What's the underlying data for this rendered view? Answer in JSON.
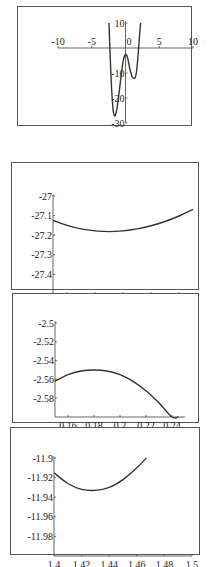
{
  "chart_data": [
    {
      "type": "line",
      "title": "",
      "xlabel": "",
      "ylabel": "",
      "xlim": [
        -10,
        10
      ],
      "ylim": [
        -30,
        10
      ],
      "x_ticks": [
        -10,
        -5,
        0,
        5,
        10
      ],
      "x_tick_labels": [
        "-10",
        "-5",
        "0",
        "5",
        "10"
      ],
      "y_ticks": [
        10,
        -10,
        -20,
        -30
      ],
      "y_tick_labels": [
        "10",
        "-10",
        "-20",
        "-30"
      ],
      "grid": false,
      "series": [
        {
          "name": "f(x)",
          "x": [
            -2.45,
            -2.2,
            -2.0,
            -1.8,
            -1.6,
            -1.4,
            -1.2,
            -1.0,
            -0.8,
            -0.6,
            -0.4,
            -0.2,
            0.0,
            0.2,
            0.4,
            0.6,
            0.8,
            1.0,
            1.2,
            1.43,
            1.6,
            1.8,
            2.0,
            2.2,
            2.3
          ],
          "y": [
            10,
            -8,
            -19,
            -25.5,
            -27.2,
            -26,
            -23,
            -19,
            -14.5,
            -10,
            -6,
            -3.5,
            -2.6,
            -3,
            -5,
            -7.8,
            -10,
            -11.6,
            -12,
            -11.9,
            -10,
            -5,
            2,
            9,
            10
          ]
        }
      ]
    },
    {
      "type": "line",
      "title": "",
      "xlabel": "",
      "ylabel": "",
      "xlim": [
        -1.65,
        -1.55
      ],
      "ylim": [
        -27.5,
        -27.0
      ],
      "x_ticks": [
        -1.64,
        -1.62,
        -1.6,
        -1.58,
        -1.56
      ],
      "x_tick_labels": [
        "-1.64",
        "-1.62",
        "-1.6",
        "-1.58",
        "-1.56"
      ],
      "y_ticks": [
        -27,
        -27.1,
        -27.2,
        -27.3,
        -27.4
      ],
      "y_tick_labels": [
        "-27",
        "-27.1",
        "-27.2",
        "-27.3",
        "-27.4"
      ],
      "grid": false,
      "series": [
        {
          "name": "zoom near x=-1.61",
          "x": [
            -1.65,
            -1.64,
            -1.63,
            -1.62,
            -1.61,
            -1.6,
            -1.59,
            -1.58,
            -1.57,
            -1.56,
            -1.55
          ],
          "y": [
            -27.125,
            -27.15,
            -27.168,
            -27.178,
            -27.182,
            -27.178,
            -27.168,
            -27.152,
            -27.13,
            -27.102,
            -27.068
          ]
        }
      ]
    },
    {
      "type": "line",
      "title": "",
      "xlabel": "",
      "ylabel": "",
      "xlim": [
        0.15,
        0.25
      ],
      "ylim": [
        -2.6,
        -2.5
      ],
      "x_ticks": [
        0.16,
        0.18,
        0.2,
        0.22,
        0.24
      ],
      "x_tick_labels": [
        "0.16",
        "0.18",
        "0.2",
        "0.22",
        "0.24"
      ],
      "y_ticks": [
        -2.5,
        -2.52,
        -2.54,
        -2.56,
        -2.58
      ],
      "y_tick_labels": [
        "-2.5",
        "-2.52",
        "-2.54",
        "-2.56",
        "-2.58"
      ],
      "grid": false,
      "series": [
        {
          "name": "zoom near x=0.18",
          "x": [
            0.15,
            0.16,
            0.17,
            0.18,
            0.19,
            0.2,
            0.21,
            0.22,
            0.23,
            0.24,
            0.245
          ],
          "y": [
            -2.562,
            -2.555,
            -2.551,
            -2.55,
            -2.551,
            -2.555,
            -2.562,
            -2.572,
            -2.585,
            -2.6,
            -2.6
          ]
        }
      ]
    },
    {
      "type": "line",
      "title": "",
      "xlabel": "",
      "ylabel": "",
      "xlim": [
        1.4,
        1.5
      ],
      "ylim": [
        -12.0,
        -11.9
      ],
      "x_ticks": [
        1.4,
        1.42,
        1.44,
        1.46,
        1.48,
        1.5
      ],
      "x_tick_labels": [
        "1.4",
        "1.42",
        "1.44",
        "1.46",
        "1.48",
        "1.5"
      ],
      "y_ticks": [
        -11.9,
        -11.92,
        -11.94,
        -11.96,
        -11.98
      ],
      "y_tick_labels": [
        "-11.9",
        "-11.92",
        "-11.94",
        "-11.96",
        "-11.98"
      ],
      "grid": false,
      "series": [
        {
          "name": "zoom near x=1.43",
          "x": [
            1.4,
            1.41,
            1.42,
            1.43,
            1.44,
            1.45,
            1.46,
            1.467
          ],
          "y": [
            -11.915,
            -11.926,
            -11.932,
            -11.933,
            -11.93,
            -11.922,
            -11.91,
            -11.9
          ]
        }
      ]
    }
  ],
  "panels": [
    {
      "box": [
        17,
        6,
        175,
        120
      ],
      "plot": [
        40,
        16,
        175,
        116
      ],
      "axes_at_zero": true
    },
    {
      "box": [
        11,
        162,
        188,
        128
      ],
      "plot": [
        41,
        33,
        181,
        131
      ],
      "axes_at_zero": false
    },
    {
      "box": [
        12,
        293,
        187,
        130
      ],
      "plot": [
        42,
        29,
        172,
        123
      ],
      "axes_at_zero": false
    },
    {
      "box": [
        10,
        427,
        190,
        128
      ],
      "plot": [
        43,
        30,
        181,
        128
      ],
      "axes_at_zero": false
    }
  ]
}
